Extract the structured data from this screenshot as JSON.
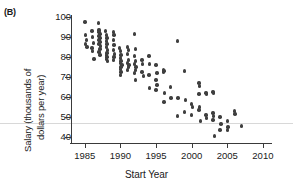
{
  "panel": {
    "label": "(B)"
  },
  "axes": {
    "xlabel": "Start Year",
    "ylabel_line1": "Salary (thousands of",
    "ylabel_line2": "dollars per year)",
    "xticks": [
      1985,
      1990,
      1995,
      2000,
      2005,
      2010
    ],
    "yticks": [
      40,
      50,
      60,
      70,
      80,
      90,
      100
    ],
    "xlim": [
      1983.2,
      2011.0
    ],
    "ylim": [
      37.0,
      101.5
    ],
    "point_color": "#3f3f3f",
    "axis_color": "#3a3a3a",
    "refline_color": "#d8d8d8",
    "refline_y": 47
  },
  "chart_data": {
    "type": "scatter",
    "title": "",
    "xlabel": "Start Year",
    "ylabel": "Salary (thousands of dollars per year)",
    "xlim": [
      1983.2,
      2011.0
    ],
    "ylim": [
      37.0,
      101.5
    ],
    "grid": false,
    "legend": "none",
    "annotations": [
      "(B)"
    ],
    "x": [
      1985.0,
      1985.1,
      1985.2,
      1985.1,
      1985.3,
      1986.0,
      1986.1,
      1986.2,
      1986.0,
      1986.1,
      1986.3,
      1986.9,
      1987.0,
      1987.0,
      1987.1,
      1987.0,
      1987.1,
      1987.0,
      1987.1,
      1987.0,
      1987.2,
      1987.1,
      1987.0,
      1987.1,
      1987.9,
      1988.0,
      1988.1,
      1988.0,
      1988.1,
      1988.0,
      1988.2,
      1988.1,
      1988.0,
      1988.1,
      1988.0,
      1988.2,
      1989.0,
      1989.1,
      1989.0,
      1989.1,
      1989.0,
      1989.2,
      1989.1,
      1989.0,
      1989.9,
      1990.0,
      1990.1,
      1990.0,
      1990.1,
      1990.0,
      1990.2,
      1990.1,
      1990.0,
      1990.1,
      1990.0,
      1991.0,
      1991.1,
      1991.0,
      1991.1,
      1991.0,
      1991.2,
      1991.1,
      1991.0,
      1992.0,
      1992.1,
      1992.0,
      1992.1,
      1992.0,
      1992.2,
      1992.1,
      1992.0,
      1992.1,
      1993.0,
      1993.1,
      1993.0,
      1993.2,
      1994.0,
      1994.1,
      1994.0,
      1994.1,
      1995.0,
      1995.1,
      1995.0,
      1995.1,
      1995.0,
      1996.0,
      1996.1,
      1996.0,
      1996.2,
      1996.1,
      1997.0,
      1997.1,
      1998.0,
      1998.1,
      1998.0,
      1999.0,
      1999.1,
      1999.0,
      2000.0,
      2000.1,
      2000.0,
      2001.0,
      2001.1,
      2001.0,
      2001.1,
      2001.0,
      2001.2,
      2002.0,
      2002.1,
      2002.0,
      2002.1,
      2003.0,
      2003.1,
      2003.0,
      2003.1,
      2003.0,
      2003.2,
      2004.0,
      2004.1,
      2004.0,
      2005.0,
      2005.1,
      2005.0,
      2006.0,
      2006.1,
      2007.0
    ],
    "y": [
      97.5,
      91.0,
      88.5,
      86.5,
      85.0,
      93.0,
      90.0,
      87.0,
      84.5,
      83.0,
      79.0,
      97.0,
      93.5,
      92.5,
      91.5,
      90.5,
      89.5,
      88.5,
      87.5,
      86.5,
      85.5,
      84.0,
      82.5,
      81.0,
      93.0,
      91.0,
      89.5,
      88.0,
      86.5,
      85.0,
      83.5,
      82.0,
      81.0,
      80.0,
      79.0,
      78.0,
      92.5,
      91.0,
      88.5,
      86.0,
      83.5,
      81.5,
      80.0,
      78.5,
      84.5,
      83.0,
      81.0,
      79.5,
      78.0,
      77.0,
      76.0,
      75.0,
      74.0,
      72.5,
      71.0,
      85.0,
      83.5,
      81.5,
      78.5,
      77.0,
      76.0,
      75.0,
      73.5,
      91.5,
      84.0,
      80.5,
      78.0,
      76.5,
      75.0,
      73.5,
      72.0,
      68.5,
      78.5,
      76.5,
      72.5,
      70.5,
      80.5,
      76.5,
      71.0,
      64.5,
      76.0,
      72.0,
      68.5,
      66.0,
      63.5,
      73.5,
      73.0,
      72.5,
      62.0,
      57.5,
      65.0,
      59.5,
      88.0,
      59.5,
      50.5,
      73.0,
      58.5,
      52.5,
      56.5,
      55.0,
      51.0,
      67.0,
      65.5,
      61.5,
      55.0,
      53.5,
      48.0,
      62.0,
      61.5,
      51.0,
      49.5,
      62.5,
      62.0,
      52.0,
      50.5,
      48.5,
      40.5,
      50.0,
      46.5,
      43.5,
      48.0,
      45.0,
      43.5,
      53.0,
      51.5,
      45.5
    ]
  }
}
